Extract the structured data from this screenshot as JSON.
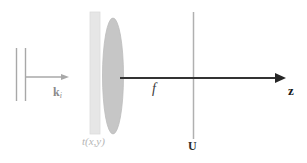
{
  "figure": {
    "background_color": "#ffffff",
    "width": 307,
    "height": 163
  },
  "colors": {
    "incident_wave": "#a8a8a8",
    "transparency_plate_fill": "#e6e6e6",
    "transparency_plate_stroke": "#d8d8d8",
    "lens_fill": "#c6c6c6",
    "lens_stroke": "#bdbdbd",
    "optical_axis": "#333333",
    "focal_plane_line": "#b0b0b0",
    "label_dark": "#1a1a1a",
    "label_gray": "#8a8a8a",
    "label_light": "#b5b5b5"
  },
  "elements": {
    "incident_wavefronts": {
      "name": "incident plane wavefronts",
      "line_count": 2,
      "x_positions": [
        16,
        25
      ],
      "y_top": 48,
      "y_bottom": 101
    },
    "incident_ray": {
      "name": "incident wavevector arrow",
      "x_start": 25,
      "x_end": 69,
      "y": 77
    },
    "transparency_plate": {
      "name": "transparency t(x,y)",
      "x": 90,
      "y": 12,
      "width": 10,
      "height": 122
    },
    "lens": {
      "name": "converging lens",
      "center_x": 113,
      "center_y": 76,
      "radius_x": 10,
      "radius_y": 58
    },
    "optical_axis": {
      "name": "optical axis z",
      "x_start": 120,
      "x_end": 286,
      "y": 78
    },
    "focal_plane": {
      "name": "back focal plane",
      "x": 193,
      "y_top": 12,
      "y_bottom": 139
    }
  },
  "labels": {
    "incident_wavevector": "k",
    "incident_wavevector_subscript": "i",
    "transparency": "t(x,y)",
    "focal_length": "f",
    "output_field": "U",
    "axis": "z"
  }
}
